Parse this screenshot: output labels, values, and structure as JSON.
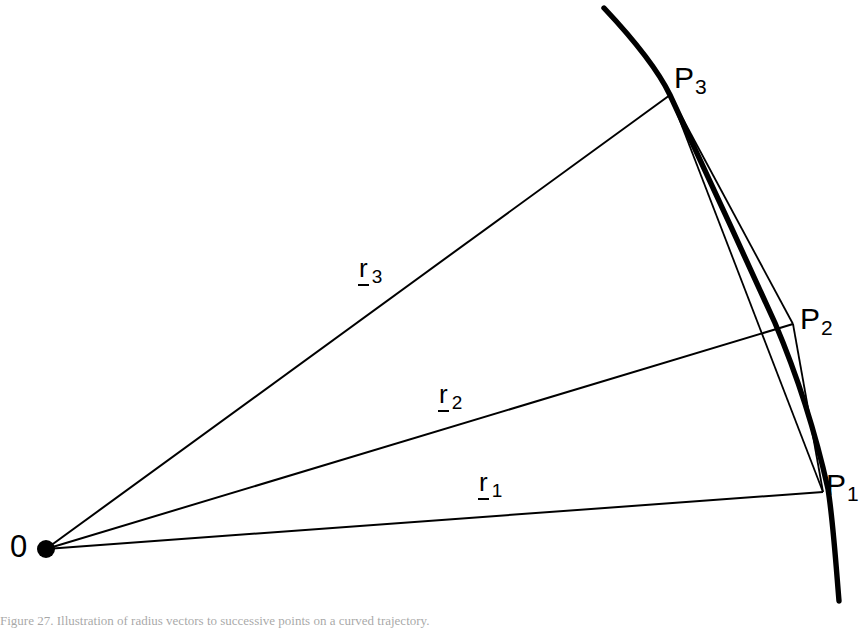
{
  "figure": {
    "background_color": "#ffffff",
    "ink_color": "#000000",
    "origin_label": "0",
    "caption": "Figure 27.  Illustration of radius vectors to successive points on a curved trajectory.",
    "points": [
      {
        "id": "P1",
        "base": "P",
        "sub": "1",
        "x": 816,
        "y": 489
      },
      {
        "id": "P2",
        "base": "P",
        "sub": "2",
        "x": 795,
        "y": 322
      },
      {
        "id": "P3",
        "base": "P",
        "sub": "3",
        "x": 669,
        "y": 93
      }
    ],
    "vectors": [
      {
        "id": "r1",
        "base": "r",
        "sub": "1",
        "label_x": 478,
        "label_y": 480,
        "underlined": true
      },
      {
        "id": "r2",
        "base": "r",
        "sub": "2",
        "label_x": 438,
        "label_y": 392,
        "underlined": true
      },
      {
        "id": "r3",
        "base": "r",
        "sub": "3",
        "label_x": 358,
        "label_y": 266,
        "underlined": true
      }
    ],
    "origin": {
      "x": 46,
      "y": 549,
      "dot_radius": 9
    },
    "curve": {
      "description": "thick concave arc passing through P3, P2 and P1",
      "stroke_width": 5,
      "start": {
        "x": 604,
        "y": 8
      },
      "end": {
        "x": 839,
        "y": 601
      }
    },
    "chords": [
      {
        "from": "P3",
        "to": "P2",
        "stroke_width": 1.7
      },
      {
        "from": "P3",
        "to": "P1",
        "stroke_width": 1.7
      },
      {
        "from": "P2",
        "to": "P1",
        "stroke_width": 1.7
      }
    ],
    "radii_lines": [
      {
        "from": "origin",
        "to": "P1",
        "stroke_width": 1.8
      },
      {
        "from": "origin",
        "to": "P2",
        "stroke_width": 1.8
      },
      {
        "from": "origin",
        "to": "P3",
        "stroke_width": 1.8
      }
    ]
  }
}
